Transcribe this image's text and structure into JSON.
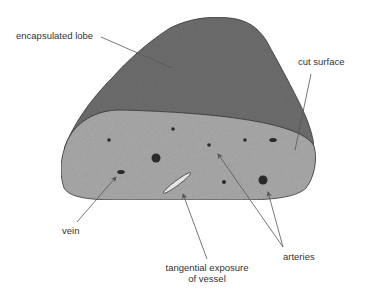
{
  "diagram": {
    "labels": {
      "encapsulated_lobe": "encapsulated lobe",
      "cut_surface": "cut surface",
      "vein": "vein",
      "tangential_line1": "tangential exposure",
      "tangential_line2": "of vessel",
      "arteries": "arteries"
    },
    "colors": {
      "lobe_fill": "#6e6e6e",
      "cut_surface_fill": "#a9a9a9",
      "outline": "#333333",
      "dot": "#2a2a2a",
      "leader": "#555555"
    }
  }
}
